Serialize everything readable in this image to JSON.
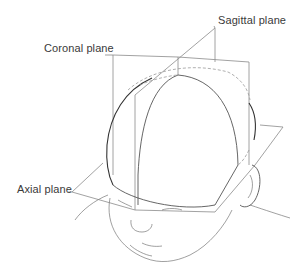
{
  "figure": {
    "labels": {
      "sagittal": "Sagittal plane",
      "coronal": "Coronal plane",
      "axial": "Axial plane"
    },
    "colors": {
      "background": "#ffffff",
      "label_text": "#3a3a3a",
      "line": "#555555",
      "plane_line": "#8a8a8a"
    }
  }
}
